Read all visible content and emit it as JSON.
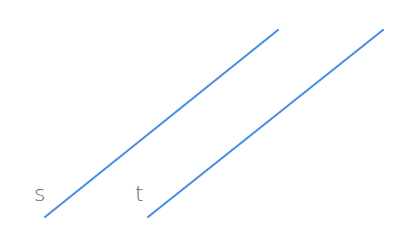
{
  "diagram": {
    "line_color": "#4a90e2",
    "label_color": "#666666",
    "lines": [
      {
        "label": "s",
        "x1": 45,
        "y1": 217,
        "x2": 278,
        "y2": 30
      },
      {
        "label": "t",
        "x1": 148,
        "y1": 217,
        "x2": 383,
        "y2": 30
      }
    ],
    "labels": [
      {
        "text": "s",
        "x": 34,
        "y": 201
      },
      {
        "text": "t",
        "x": 135,
        "y": 201
      }
    ]
  }
}
